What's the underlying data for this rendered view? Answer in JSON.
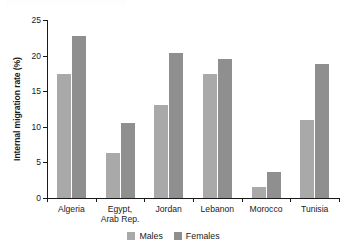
{
  "chart_data": {
    "type": "bar",
    "title": "",
    "xlabel": "",
    "ylabel": "Internal migration rate (%)",
    "ylim": [
      0,
      25
    ],
    "yticks": [
      0,
      5,
      10,
      15,
      20,
      25
    ],
    "ytick_labels": [
      "0",
      "5",
      "10",
      "15",
      "20",
      "25"
    ],
    "grid": false,
    "legend_position": "bottom",
    "categories": [
      "Algeria",
      "Egypt,\nArab Rep.",
      "Jordan",
      "Lebanon",
      "Morocco",
      "Tunisia"
    ],
    "series": [
      {
        "name": "Males",
        "color": "#a9a9a9",
        "values": [
          17.4,
          6.3,
          13.0,
          17.4,
          1.6,
          10.9
        ]
      },
      {
        "name": "Females",
        "color": "#8f8f8f",
        "values": [
          22.8,
          10.6,
          20.4,
          19.5,
          3.7,
          18.8
        ]
      }
    ]
  },
  "legend": {
    "items": [
      {
        "label": "Males",
        "color": "#a9a9a9"
      },
      {
        "label": "Females",
        "color": "#8f8f8f"
      }
    ]
  },
  "axis": {
    "y_title": "Internal migration rate (%)"
  }
}
